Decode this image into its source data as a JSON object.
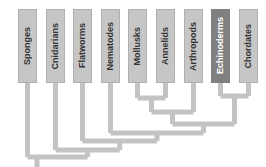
{
  "diagram": {
    "type": "cladogram",
    "orientation": "vertical-labels-top",
    "colors": {
      "background": "#ffffff",
      "branch": "#c3c3c3",
      "box_fill": "#c6c6c6",
      "box_fill_highlight": "#808080",
      "box_border": "#b0b0b0",
      "label_text": "#333333",
      "label_text_highlight": "#ffffff"
    },
    "taxa": [
      {
        "id": "sponges",
        "label": "Sponges",
        "x": 18,
        "highlight": false
      },
      {
        "id": "cnidarians",
        "label": "Cnidarians",
        "x": 46,
        "highlight": false
      },
      {
        "id": "flatworms",
        "label": "Flatworms",
        "x": 73,
        "highlight": false
      },
      {
        "id": "nematodes",
        "label": "Nematodes",
        "x": 101,
        "highlight": false
      },
      {
        "id": "mollusks",
        "label": "Mollusks",
        "x": 128,
        "highlight": false
      },
      {
        "id": "annelids",
        "label": "Annelids",
        "x": 156,
        "highlight": false
      },
      {
        "id": "arthropods",
        "label": "Arthropods",
        "x": 184,
        "highlight": false
      },
      {
        "id": "echinoderms",
        "label": "Echinoderms",
        "x": 211,
        "highlight": true
      },
      {
        "id": "chordates",
        "label": "Chordates",
        "x": 239,
        "highlight": false
      }
    ],
    "box_geometry": {
      "top": 9,
      "height": 74,
      "width": 19
    },
    "nodes": [
      {
        "id": "mollusks-annelids",
        "children": [
          "mollusks",
          "annelids"
        ],
        "y": 98
      },
      {
        "id": "echino-chordates",
        "children": [
          "echinoderms",
          "chordates"
        ],
        "y": 96
      },
      {
        "id": "protostome-core",
        "children": [
          "mollusks-annelids",
          "arthropods"
        ],
        "y": 112
      },
      {
        "id": "bilateria-deutero",
        "children": [
          "protostome-core",
          "echino-chordates"
        ],
        "y": 124
      },
      {
        "id": "nematode-clade",
        "children": [
          "nematodes",
          "bilateria-deutero"
        ],
        "y": 133
      },
      {
        "id": "flatworm-clade",
        "children": [
          "flatworms",
          "nematode-clade"
        ],
        "y": 141
      },
      {
        "id": "cnidarian-clade",
        "children": [
          "cnidarians",
          "flatworm-clade"
        ],
        "y": 150
      },
      {
        "id": "root",
        "children": [
          "sponges",
          "cnidarian-clade"
        ],
        "y": 157
      }
    ],
    "root_stem": {
      "x": 37,
      "y_top": 157,
      "y_bottom": 167
    }
  }
}
